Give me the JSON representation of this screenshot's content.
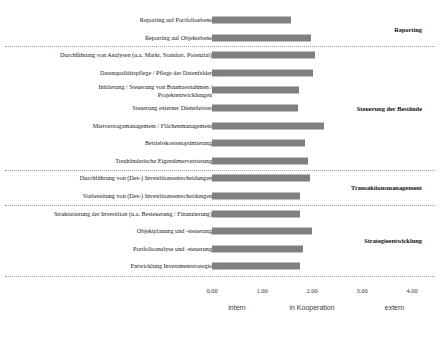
{
  "chart_data": {
    "type": "bar",
    "orientation": "horizontal",
    "title": "",
    "xlabel": "",
    "ylabel": "",
    "xlim": [
      0,
      4
    ],
    "xticks": [
      "0.00",
      "1.00",
      "2.00",
      "3.00",
      "4.00"
    ],
    "xtick_values": [
      0,
      1,
      2,
      3,
      4
    ],
    "grid": false,
    "bar_color": "#808080",
    "zone_labels": [
      {
        "label": "intern",
        "value": 0.5
      },
      {
        "label": "in Kooperation",
        "value": 2.0
      },
      {
        "label": "extern",
        "value": 3.65
      }
    ],
    "groups": [
      {
        "name": "Reporting",
        "categories": [
          "Reporting auf Portfolioebene",
          "Reporting auf Objektebene"
        ],
        "values": [
          1.58,
          1.98
        ]
      },
      {
        "name": "Steuerung der Bestände",
        "categories": [
          "Durchführung von Analysen (u.a. Markt, Standort, Potenzial)",
          "Datenqualitätspflege / Pflege der Datenfelder",
          "Initiierung / Steuerung von Baumassnahmen /\nProjektentwicklungen",
          "Steuerung externer Dienstleister",
          "Mietvertragsmanagement / Flächenmanagement",
          "Betriebskostenoptimierung",
          "Treuhänderische Eigentümervertretung"
        ],
        "values": [
          2.06,
          2.02,
          1.74,
          1.72,
          2.24,
          1.86,
          1.92
        ]
      },
      {
        "name": "Transaktionsmanagement",
        "categories": [
          "Durchführung von (Des-) Investitionsentscheidungen",
          "Vorbereitung von (Des-) Investitionsentscheidungen"
        ],
        "values": [
          1.96,
          1.76
        ]
      },
      {
        "name": "Strategieentwicklung",
        "categories": [
          "Strukturierung der Investition (u.a. Besteuerung / Finanzierung)",
          "Objektplanung und -steuerung",
          "Portfolioanalyse und -steuerung",
          "Entwicklung Investmentstrategie"
        ],
        "values": [
          1.76,
          2.0,
          1.82,
          1.76
        ]
      }
    ]
  }
}
